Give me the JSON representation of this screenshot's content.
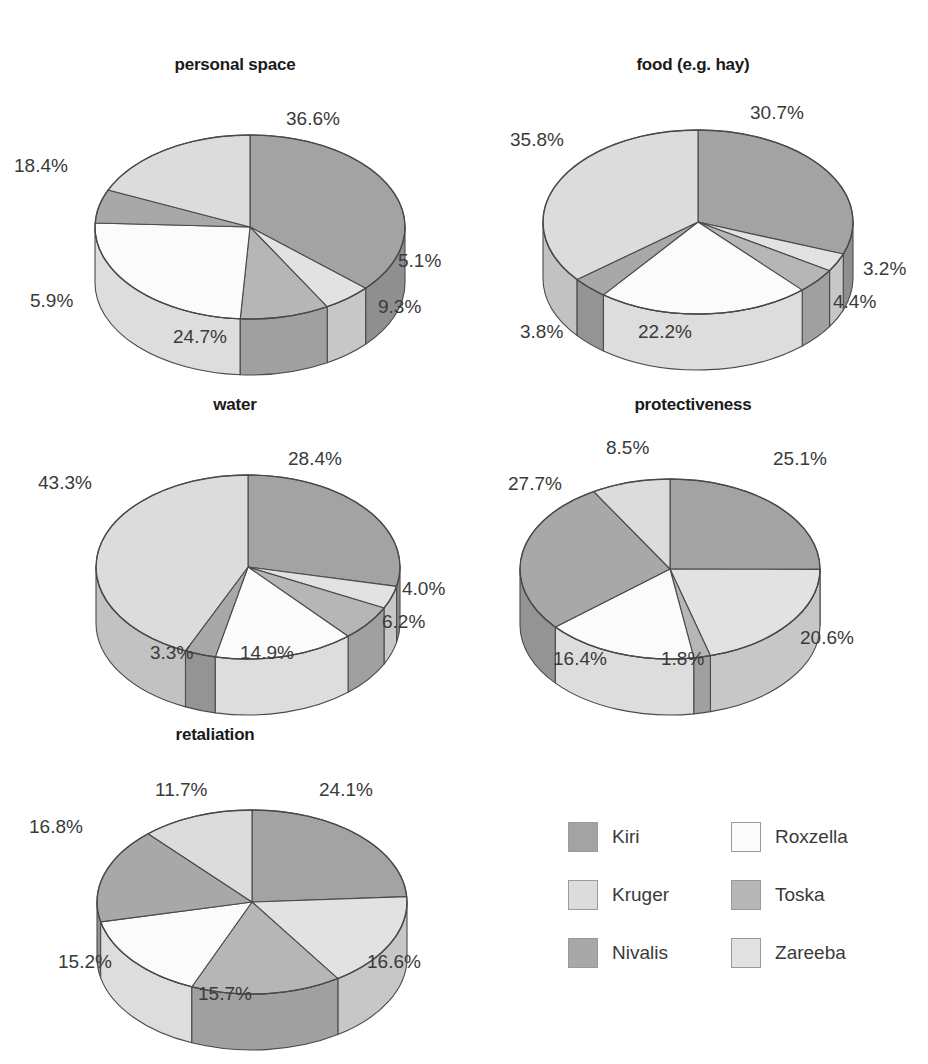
{
  "figure": {
    "background": "#ffffff",
    "label_suffix": "%"
  },
  "palette": {
    "Kiri": "#a3a3a3",
    "Kruger": "#dcdcdc",
    "Nivalis": "#a8a8a8",
    "Roxzella": "#fbfbfb",
    "Toska": "#b6b6b6",
    "Zareeba": "#e2e2e2",
    "outline": "#4a4a4a",
    "text": "#3a3a3a",
    "title_text": "#1a1a1a"
  },
  "legend": {
    "entries": [
      {
        "label": "Kiri",
        "color": "#a3a3a3"
      },
      {
        "label": "Roxzella",
        "color": "#fbfbfb"
      },
      {
        "label": "Kruger",
        "color": "#dcdcdc"
      },
      {
        "label": "Toska",
        "color": "#b6b6b6"
      },
      {
        "label": "Nivalis",
        "color": "#a8a8a8"
      },
      {
        "label": "Zareeba",
        "color": "#e2e2e2"
      }
    ]
  },
  "chart_data": [
    {
      "type": "pie",
      "title": "personal space",
      "categories": [
        "Kiri",
        "Zareeba",
        "Toska",
        "Roxzella",
        "Nivalis",
        "Kruger"
      ],
      "values": [
        36.6,
        5.1,
        9.3,
        24.7,
        5.9,
        18.4
      ],
      "labels": [
        "36.6%",
        "5.1%",
        "9.3%",
        "24.7%",
        "5.9%",
        "18.4%"
      ],
      "unit": "%"
    },
    {
      "type": "pie",
      "title": "food (e.g. hay)",
      "categories": [
        "Kiri",
        "Zareeba",
        "Toska",
        "Roxzella",
        "Nivalis",
        "Kruger"
      ],
      "values": [
        30.7,
        3.2,
        4.4,
        22.2,
        3.8,
        35.8
      ],
      "labels": [
        "30.7%",
        "3.2%",
        "4.4%",
        "22.2%",
        "3.8%",
        "35.8%"
      ],
      "unit": "%"
    },
    {
      "type": "pie",
      "title": "water",
      "categories": [
        "Kiri",
        "Zareeba",
        "Toska",
        "Roxzella",
        "Nivalis",
        "Kruger"
      ],
      "values": [
        28.4,
        4.0,
        6.2,
        14.9,
        3.3,
        43.3
      ],
      "labels": [
        "28.4%",
        "4.0%",
        "6.2%",
        "14.9%",
        "3.3%",
        "43.3%"
      ],
      "unit": "%"
    },
    {
      "type": "pie",
      "title": "protectiveness",
      "categories": [
        "Kiri",
        "Zareeba",
        "Toska",
        "Roxzella",
        "Nivalis",
        "Kruger"
      ],
      "values": [
        25.1,
        20.6,
        1.8,
        16.4,
        27.7,
        8.5
      ],
      "labels": [
        "25.1%",
        "20.6%",
        "1.8%",
        "16.4%",
        "27.7%",
        "8.5%"
      ],
      "unit": "%"
    },
    {
      "type": "pie",
      "title": "retaliation",
      "categories": [
        "Kiri",
        "Zareeba",
        "Toska",
        "Roxzella",
        "Nivalis",
        "Kruger"
      ],
      "values": [
        24.1,
        16.6,
        15.7,
        15.2,
        16.8,
        11.7
      ],
      "labels": [
        "24.1%",
        "16.6%",
        "15.7%",
        "15.2%",
        "16.8%",
        "11.7%"
      ],
      "unit": "%"
    }
  ],
  "charts": [
    {
      "title": "personal space",
      "slices": [
        {
          "name": "Kiri",
          "value": 36.6,
          "label": "36.6%",
          "label_x": 286,
          "label_y": 108
        },
        {
          "name": "Zareeba",
          "value": 5.1,
          "label": "5.1%",
          "label_x": 398,
          "label_y": 250
        },
        {
          "name": "Toska",
          "value": 9.3,
          "label": "9.3%",
          "label_x": 378,
          "label_y": 296
        },
        {
          "name": "Roxzella",
          "value": 24.7,
          "label": "24.7%",
          "label_x": 173,
          "label_y": 326
        },
        {
          "name": "Nivalis",
          "value": 5.9,
          "label": "5.9%",
          "label_x": 30,
          "label_y": 290
        },
        {
          "name": "Kruger",
          "value": 18.4,
          "label": "18.4%",
          "label_x": 14,
          "label_y": 155
        }
      ]
    },
    {
      "title": "food (e.g. hay)",
      "slices": [
        {
          "name": "Kiri",
          "value": 30.7,
          "label": "30.7%",
          "label_x": 750,
          "label_y": 102
        },
        {
          "name": "Zareeba",
          "value": 3.2,
          "label": "3.2%",
          "label_x": 863,
          "label_y": 258
        },
        {
          "name": "Toska",
          "value": 4.4,
          "label": "4.4%",
          "label_x": 833,
          "label_y": 291
        },
        {
          "name": "Roxzella",
          "value": 22.2,
          "label": "22.2%",
          "label_x": 638,
          "label_y": 321
        },
        {
          "name": "Nivalis",
          "value": 3.8,
          "label": "3.8%",
          "label_x": 520,
          "label_y": 321
        },
        {
          "name": "Kruger",
          "value": 35.8,
          "label": "35.8%",
          "label_x": 510,
          "label_y": 129
        }
      ]
    },
    {
      "title": "water",
      "slices": [
        {
          "name": "Kiri",
          "value": 28.4,
          "label": "28.4%",
          "label_x": 288,
          "label_y": 448
        },
        {
          "name": "Zareeba",
          "value": 4.0,
          "label": "4.0%",
          "label_x": 402,
          "label_y": 578
        },
        {
          "name": "Toska",
          "value": 6.2,
          "label": "6.2%",
          "label_x": 382,
          "label_y": 611
        },
        {
          "name": "Roxzella",
          "value": 14.9,
          "label": "14.9%",
          "label_x": 240,
          "label_y": 642
        },
        {
          "name": "Nivalis",
          "value": 3.3,
          "label": "3.3%",
          "label_x": 150,
          "label_y": 642
        },
        {
          "name": "Kruger",
          "value": 43.3,
          "label": "43.3%",
          "label_x": 38,
          "label_y": 472
        }
      ]
    },
    {
      "title": "protectiveness",
      "slices": [
        {
          "name": "Kiri",
          "value": 25.1,
          "label": "25.1%",
          "label_x": 773,
          "label_y": 448
        },
        {
          "name": "Zareeba",
          "value": 20.6,
          "label": "20.6%",
          "label_x": 800,
          "label_y": 627
        },
        {
          "name": "Toska",
          "value": 1.8,
          "label": "1.8%",
          "label_x": 661,
          "label_y": 648
        },
        {
          "name": "Roxzella",
          "value": 16.4,
          "label": "16.4%",
          "label_x": 553,
          "label_y": 648
        },
        {
          "name": "Nivalis",
          "value": 27.7,
          "label": "27.7%",
          "label_x": 508,
          "label_y": 473
        },
        {
          "name": "Kruger",
          "value": 8.5,
          "label": "8.5%",
          "label_x": 606,
          "label_y": 437
        }
      ]
    },
    {
      "title": "retaliation",
      "slices": [
        {
          "name": "Kiri",
          "value": 24.1,
          "label": "24.1%",
          "label_x": 319,
          "label_y": 779
        },
        {
          "name": "Zareeba",
          "value": 16.6,
          "label": "16.6%",
          "label_x": 367,
          "label_y": 951
        },
        {
          "name": "Toska",
          "value": 15.7,
          "label": "15.7%",
          "label_x": 198,
          "label_y": 983
        },
        {
          "name": "Roxzella",
          "value": 15.2,
          "label": "15.2%",
          "label_x": 58,
          "label_y": 951
        },
        {
          "name": "Nivalis",
          "value": 16.8,
          "label": "16.8%",
          "label_x": 29,
          "label_y": 816
        },
        {
          "name": "Kruger",
          "value": 11.7,
          "label": "11.7%",
          "label_x": 155,
          "label_y": 779
        }
      ]
    }
  ]
}
